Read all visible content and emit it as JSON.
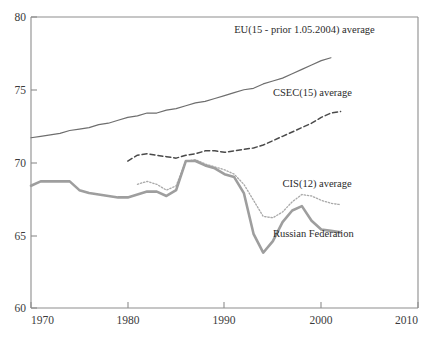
{
  "chart_data": {
    "type": "line",
    "title": "",
    "xlabel": "",
    "ylabel": "",
    "xlim": [
      1970,
      2010
    ],
    "ylim": [
      60,
      80
    ],
    "grid": false,
    "legend_position": "inline-annotations",
    "xticks": [
      "1970",
      "1980",
      "1990",
      "2000",
      "2010"
    ],
    "yticks": [
      "60",
      "65",
      "70",
      "75",
      "80"
    ],
    "series": [
      {
        "name": "EU(15 - prior 1.05.2004) average",
        "label": "EU(15 - prior 1.05.2004) average",
        "style": "solid-thin",
        "color": "#6e6e6e",
        "x": [
          1970,
          1971,
          1972,
          1973,
          1974,
          1975,
          1976,
          1977,
          1978,
          1979,
          1980,
          1981,
          1982,
          1983,
          1984,
          1985,
          1986,
          1987,
          1988,
          1989,
          1990,
          1991,
          1992,
          1993,
          1994,
          1995,
          1996,
          1997,
          1998,
          1999,
          2000,
          2001
        ],
        "values": [
          71.7,
          71.8,
          71.9,
          72.0,
          72.2,
          72.3,
          72.4,
          72.6,
          72.7,
          72.9,
          73.1,
          73.2,
          73.4,
          73.4,
          73.6,
          73.7,
          73.9,
          74.1,
          74.2,
          74.4,
          74.6,
          74.8,
          75.0,
          75.1,
          75.4,
          75.6,
          75.8,
          76.1,
          76.4,
          76.7,
          77.0,
          77.2
        ],
        "annotation_at": [
          1991,
          78.9
        ]
      },
      {
        "name": "CSEC(15) average",
        "label": "CSEC(15) average",
        "style": "dashed",
        "color": "#4a4a4a",
        "x": [
          1980,
          1981,
          1982,
          1983,
          1984,
          1985,
          1986,
          1987,
          1988,
          1989,
          1990,
          1991,
          1992,
          1993,
          1994,
          1995,
          1996,
          1997,
          1998,
          1999,
          2000,
          2001,
          2002
        ],
        "values": [
          70.1,
          70.5,
          70.6,
          70.5,
          70.4,
          70.3,
          70.5,
          70.6,
          70.8,
          70.8,
          70.7,
          70.8,
          70.9,
          71.0,
          71.2,
          71.5,
          71.8,
          72.1,
          72.4,
          72.7,
          73.1,
          73.4,
          73.5
        ],
        "annotation_at": [
          1995,
          74.6
        ]
      },
      {
        "name": "CIS(12) average",
        "label": "CIS(12) average",
        "style": "dotted",
        "color": "#a9a9a9",
        "x": [
          1981,
          1982,
          1983,
          1984,
          1985,
          1986,
          1987,
          1988,
          1989,
          1990,
          1991,
          1992,
          1993,
          1994,
          1995,
          1996,
          1997,
          1998,
          1999,
          2000,
          2001,
          2002
        ],
        "values": [
          68.5,
          68.7,
          68.5,
          68.1,
          68.4,
          70.1,
          70.2,
          69.9,
          69.7,
          69.5,
          69.2,
          68.5,
          67.4,
          66.3,
          66.2,
          66.6,
          67.3,
          67.8,
          67.7,
          67.4,
          67.2,
          67.1
        ],
        "annotation_at": [
          1996,
          68.3
        ]
      },
      {
        "name": "Russian Federation",
        "label": "Russian Federation",
        "style": "solid-thick",
        "color": "#9e9e9e",
        "x": [
          1970,
          1971,
          1972,
          1973,
          1974,
          1975,
          1976,
          1977,
          1978,
          1979,
          1980,
          1981,
          1982,
          1983,
          1984,
          1985,
          1986,
          1987,
          1988,
          1989,
          1990,
          1991,
          1992,
          1993,
          1994,
          1995,
          1996,
          1997,
          1998,
          1999,
          2000,
          2001,
          2002
        ],
        "values": [
          68.4,
          68.7,
          68.7,
          68.7,
          68.7,
          68.1,
          67.9,
          67.8,
          67.7,
          67.6,
          67.6,
          67.8,
          68.0,
          68.0,
          67.7,
          68.1,
          70.1,
          70.1,
          69.8,
          69.6,
          69.2,
          69.0,
          67.9,
          65.1,
          63.8,
          64.6,
          65.9,
          66.7,
          67.0,
          66.0,
          65.4,
          65.3,
          65.2
        ],
        "annotation_at": [
          1995,
          64.9
        ]
      }
    ]
  }
}
